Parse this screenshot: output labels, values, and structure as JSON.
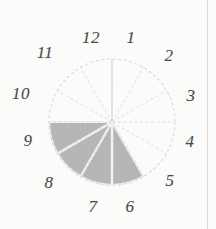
{
  "figure": {
    "type": "pie",
    "background_color": "#fbfbfa",
    "outline_color": "#d9d9d9",
    "spoke_color": "#dedede",
    "shaded_color": "#b6b6b6",
    "separator_color": "#f2f2f2",
    "label_color": "#4a4a4a",
    "center": {
      "x": 112,
      "y": 122
    },
    "radius": 63
  },
  "chart_data": {
    "type": "pie",
    "title": "",
    "xlabel": "",
    "ylabel": "",
    "legend": [],
    "grid": false,
    "categories": [
      "1",
      "2",
      "3",
      "4",
      "5",
      "6",
      "7",
      "8",
      "9",
      "10",
      "11",
      "12"
    ],
    "values": [
      1,
      1,
      1,
      1,
      1,
      1,
      1,
      1,
      1,
      1,
      1,
      1
    ],
    "slice_count": 12,
    "slice_degrees": 30,
    "start_angle_deg": 0,
    "shaded_slices": [
      "6",
      "7",
      "8",
      "9"
    ],
    "unshaded_slices": [
      "1",
      "2",
      "3",
      "4",
      "5",
      "10",
      "11",
      "12"
    ],
    "shaded_count": 4,
    "unshaded_count": 8,
    "shaded_fraction": "4/12",
    "annotations": []
  },
  "hour_labels": [
    {
      "text": "12",
      "x": 91,
      "y": 37
    },
    {
      "text": "1",
      "x": 131,
      "y": 37
    },
    {
      "text": "2",
      "x": 169,
      "y": 55
    },
    {
      "text": "3",
      "x": 191,
      "y": 95
    },
    {
      "text": "4",
      "x": 190,
      "y": 141
    },
    {
      "text": "5",
      "x": 170,
      "y": 180
    },
    {
      "text": "6",
      "x": 130,
      "y": 206
    },
    {
      "text": "7",
      "x": 93,
      "y": 206
    },
    {
      "text": "8",
      "x": 49,
      "y": 182
    },
    {
      "text": "9",
      "x": 28,
      "y": 140
    },
    {
      "text": "10",
      "x": 21,
      "y": 93
    },
    {
      "text": "11",
      "x": 45,
      "y": 52
    }
  ]
}
